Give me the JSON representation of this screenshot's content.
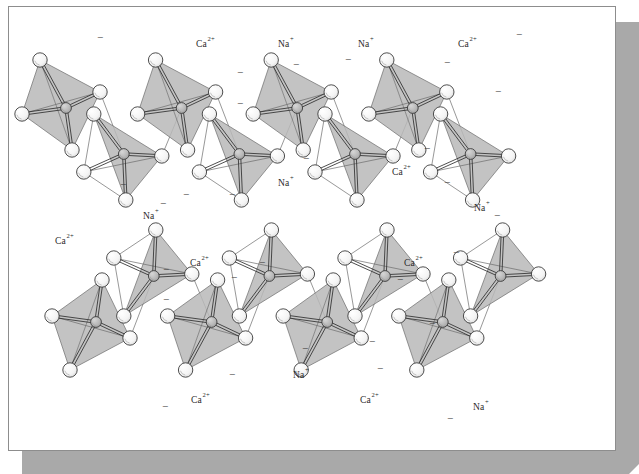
{
  "figure": {
    "frame": {
      "card_fill": "#ffffff",
      "card_border": "#8d8d8d",
      "shadow_fill": "#a9a9a9"
    },
    "palette": {
      "tetra_face": "#b8b8b8",
      "atom_fill": "#f2f2f2",
      "atom_stroke": "#3c3c3c",
      "si_fill": "#b4b4b4",
      "bond": "#2f2f2f",
      "thin_line": "#6b6b6b",
      "label": "#2a2a2a"
    },
    "legend_glyphs": {
      "charge_symbol": "−",
      "sodium": "Na",
      "sodium_charge": "+",
      "calcium": "Ca",
      "calcium_charge": "2+"
    }
  },
  "chart_data": {
    "type": "diagram",
    "chains": [
      {
        "name": "upper-chain",
        "tetrahedra_count": 8
      },
      {
        "name": "lower-chain",
        "tetrahedra_count": 8
      }
    ],
    "ion_labels": [
      {
        "id": "ion-1",
        "species": "Ca",
        "charge": "2+",
        "text": "Ca",
        "sup": "2+",
        "x": 196,
        "y": 47,
        "chain": "upper"
      },
      {
        "id": "ion-2",
        "species": "Na",
        "charge": "+",
        "text": "Na",
        "sup": "+",
        "x": 278,
        "y": 47,
        "chain": "upper"
      },
      {
        "id": "ion-3",
        "species": "Na",
        "charge": "+",
        "text": "Na",
        "sup": "+",
        "x": 358,
        "y": 47,
        "chain": "upper"
      },
      {
        "id": "ion-4",
        "species": "Ca",
        "charge": "2+",
        "text": "Ca",
        "sup": "2+",
        "x": 458,
        "y": 47,
        "chain": "upper"
      },
      {
        "id": "ion-5",
        "species": "Na",
        "charge": "+",
        "text": "Na",
        "sup": "+",
        "x": 278,
        "y": 186,
        "chain": "upper"
      },
      {
        "id": "ion-6",
        "species": "Ca",
        "charge": "2+",
        "text": "Ca",
        "sup": "2+",
        "x": 392,
        "y": 175,
        "chain": "upper"
      },
      {
        "id": "ion-7",
        "species": "Na",
        "charge": "+",
        "text": "Na",
        "sup": "+",
        "x": 143,
        "y": 219,
        "chain": "upper"
      },
      {
        "id": "ion-8",
        "species": "Na",
        "charge": "+",
        "text": "Na",
        "sup": "+",
        "x": 474,
        "y": 211,
        "chain": "upper"
      },
      {
        "id": "ion-9",
        "species": "Ca",
        "charge": "2+",
        "text": "Ca",
        "sup": "2+",
        "x": 55,
        "y": 244,
        "chain": "lower"
      },
      {
        "id": "ion-10",
        "species": "Ca",
        "charge": "2+",
        "text": "Ca",
        "sup": "2+",
        "x": 190,
        "y": 266,
        "chain": "lower"
      },
      {
        "id": "ion-11",
        "species": "Ca",
        "charge": "2+",
        "text": "Ca",
        "sup": "2+",
        "x": 404,
        "y": 266,
        "chain": "lower"
      },
      {
        "id": "ion-12",
        "species": "Na",
        "charge": "+",
        "text": "Na",
        "sup": "+",
        "x": 293,
        "y": 378,
        "chain": "lower"
      },
      {
        "id": "ion-13",
        "species": "Ca",
        "charge": "2+",
        "text": "Ca",
        "sup": "2+",
        "x": 191,
        "y": 403,
        "chain": "lower"
      },
      {
        "id": "ion-14",
        "species": "Ca",
        "charge": "2+",
        "text": "Ca",
        "sup": "2+",
        "x": 360,
        "y": 403,
        "chain": "lower"
      },
      {
        "id": "ion-15",
        "species": "Na",
        "charge": "+",
        "text": "Na",
        "sup": "+",
        "x": 473,
        "y": 410,
        "chain": "lower"
      }
    ],
    "charge_marks": [
      {
        "x": 100,
        "y": 41
      },
      {
        "x": 240,
        "y": 76
      },
      {
        "x": 240,
        "y": 107
      },
      {
        "x": 296,
        "y": 68
      },
      {
        "x": 348,
        "y": 63
      },
      {
        "x": 186,
        "y": 198
      },
      {
        "x": 232,
        "y": 198
      },
      {
        "x": 306,
        "y": 162
      },
      {
        "x": 123,
        "y": 188
      },
      {
        "x": 163,
        "y": 207
      },
      {
        "x": 447,
        "y": 66
      },
      {
        "x": 427,
        "y": 152
      },
      {
        "x": 519,
        "y": 38
      },
      {
        "x": 498,
        "y": 95
      },
      {
        "x": 447,
        "y": 186
      },
      {
        "x": 497,
        "y": 219
      },
      {
        "x": 166,
        "y": 273
      },
      {
        "x": 166,
        "y": 303
      },
      {
        "x": 234,
        "y": 281
      },
      {
        "x": 262,
        "y": 266
      },
      {
        "x": 232,
        "y": 378
      },
      {
        "x": 305,
        "y": 352
      },
      {
        "x": 165,
        "y": 410
      },
      {
        "x": 400,
        "y": 283
      },
      {
        "x": 372,
        "y": 345
      },
      {
        "x": 380,
        "y": 372
      },
      {
        "x": 456,
        "y": 256
      },
      {
        "x": 432,
        "y": 327
      },
      {
        "x": 450,
        "y": 422
      }
    ]
  }
}
